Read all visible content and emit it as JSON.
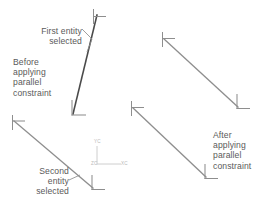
{
  "diagram": {
    "background": "#ffffff",
    "width": 271,
    "height": 217,
    "colors": {
      "selected_entity": "#4a4a4a",
      "unselected_entity": "#8e8e8e",
      "marker": "#8e8e8e",
      "leader": "#8e8e8e",
      "text": "#5a5a5a",
      "axis": "#c8c8c8",
      "axis_text": "#b9b9b9"
    }
  },
  "annotations": {
    "first_entity": {
      "text": "First entity\nselected",
      "align": "right",
      "x": 22,
      "y": 27
    },
    "before": {
      "text": "Before\napplying\nparallel\nconstraint",
      "align": "left",
      "x": 13,
      "y": 58
    },
    "second_entity": {
      "text": "Second\nentity\nselected",
      "align": "right",
      "x": 13,
      "y": 167
    },
    "after": {
      "text": "After\napplying\nparallel\nconstraint",
      "align": "left",
      "x": 213,
      "y": 131
    }
  },
  "axis_triad": {
    "y_label": "YC",
    "z_label": "ZC",
    "x_label": "XC",
    "origin_x": 97,
    "origin_y": 164
  },
  "entities": {
    "before": [
      {
        "name": "first-entity-line",
        "state": "selected",
        "x1": 97,
        "y1": 15,
        "x2": 73,
        "y2": 114
      },
      {
        "name": "second-entity-line",
        "state": "selected",
        "x1": 14,
        "y1": 121,
        "x2": 93,
        "y2": 188
      }
    ],
    "after": [
      {
        "name": "result-line-upper",
        "state": "normal",
        "x1": 164,
        "y1": 39,
        "x2": 238,
        "y2": 107
      },
      {
        "name": "result-line-lower",
        "state": "normal",
        "x1": 133,
        "y1": 108,
        "x2": 206,
        "y2": 177
      }
    ]
  },
  "leaders": {
    "first_entity_leader": {
      "x1": 83,
      "y1": 28,
      "x2": 92,
      "y2": 37,
      "x3": 88,
      "y3": 52
    },
    "second_entity_leader": {
      "x1": 70,
      "y1": 180,
      "x2": 80,
      "y2": 175
    }
  }
}
